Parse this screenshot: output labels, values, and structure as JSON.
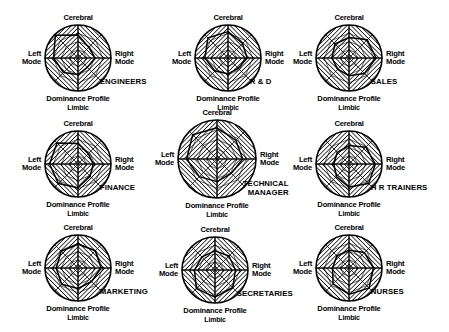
{
  "figure": {
    "axis_labels": {
      "top": "Cerebral",
      "bottom": "Limbic",
      "left": "Left\nMode",
      "left_line1": "Left",
      "left_line2": "Mode",
      "right_line1": "Right",
      "right_line2": "Mode",
      "caption": "Dominance Profile"
    },
    "colors": {
      "ink": "#000000",
      "background": "#ffffff",
      "hatch": "#000000"
    },
    "grid": {
      "rows": 3,
      "cols": 3
    }
  },
  "chart_data": {
    "type": "radar",
    "axes": [
      "Cerebral",
      "Cerebral-Right",
      "Right Mode",
      "Limbic-Right",
      "Limbic",
      "Limbic-Left",
      "Left Mode",
      "Cerebral-Left"
    ],
    "axis_order_note": "Values listed clockwise starting at top (Cerebral).",
    "rmax": 1.0,
    "rings": [
      0.25,
      0.5,
      0.75,
      1.0
    ],
    "grid": true,
    "legend": "none",
    "series": [
      {
        "name": "ENGINEERS",
        "row": 1,
        "col": 1,
        "values": [
          0.7,
          0.46,
          0.52,
          0.4,
          0.5,
          0.62,
          0.74,
          0.97
        ]
      },
      {
        "name": "R & D",
        "row": 1,
        "col": 2,
        "values": [
          0.8,
          0.62,
          0.58,
          0.44,
          0.48,
          0.56,
          0.7,
          0.86
        ]
      },
      {
        "name": "SALES",
        "row": 1,
        "col": 3,
        "values": [
          0.62,
          0.78,
          0.82,
          0.66,
          0.54,
          0.48,
          0.52,
          0.6
        ]
      },
      {
        "name": "FINANCE",
        "row": 2,
        "col": 1,
        "values": [
          0.62,
          0.44,
          0.46,
          0.52,
          0.72,
          0.84,
          0.86,
          0.9
        ]
      },
      {
        "name": "TECHNICAL MANAGER",
        "row": 2,
        "col": 2,
        "values": [
          0.8,
          0.68,
          0.66,
          0.52,
          0.58,
          0.64,
          0.78,
          0.88
        ]
      },
      {
        "name": "H R TRAINERS",
        "row": 2,
        "col": 3,
        "values": [
          0.56,
          0.72,
          0.8,
          0.84,
          0.7,
          0.54,
          0.46,
          0.5
        ]
      },
      {
        "name": "MARKETING",
        "row": 3,
        "col": 1,
        "values": [
          0.72,
          0.74,
          0.7,
          0.58,
          0.62,
          0.7,
          0.66,
          0.72
        ]
      },
      {
        "name": "SECRETARIES",
        "row": 3,
        "col": 2,
        "values": [
          0.58,
          0.6,
          0.62,
          0.76,
          0.82,
          0.8,
          0.62,
          0.56
        ]
      },
      {
        "name": "NURSES",
        "row": 3,
        "col": 3,
        "values": [
          0.54,
          0.66,
          0.74,
          0.86,
          0.8,
          0.68,
          0.5,
          0.52
        ]
      }
    ]
  },
  "cells": [
    {
      "occupation": "ENGINEERS",
      "occupation_lines": [
        "ENGINEERS"
      ],
      "top": "Cerebral",
      "bottom": "Limbic",
      "caption": "Dominance Profile",
      "left1": "Left",
      "left2": "Mode",
      "right1": "Right",
      "right2": "Mode"
    },
    {
      "occupation": "R & D",
      "occupation_lines": [
        "R & D"
      ],
      "top": "Cerebral",
      "bottom": "Limbic",
      "caption": "Dominance Profile",
      "left1": "Left",
      "left2": "Mode",
      "right1": "Right",
      "right2": "Mode"
    },
    {
      "occupation": "SALES",
      "occupation_lines": [
        "SALES"
      ],
      "top": "Cerebral",
      "bottom": "Limbic",
      "caption": "Dominance Profile",
      "left1": "Left",
      "left2": "Mode",
      "right1": "Right",
      "right2": "Mode"
    },
    {
      "occupation": "FINANCE",
      "occupation_lines": [
        "FINANCE"
      ],
      "top": "Cerebral",
      "bottom": "Limbic",
      "caption": "Dominance Profile",
      "left1": "Left",
      "left2": "Mode",
      "right1": "Right",
      "right2": "Mode"
    },
    {
      "occupation": "TECHNICAL MANAGER",
      "occupation_lines": [
        "TECHNICAL",
        "MANAGER"
      ],
      "top": "Cerebral",
      "bottom": "Limbic",
      "caption": "Dominance Profile",
      "left1": "Left",
      "left2": "Mode",
      "right1": "Right",
      "right2": "Mode"
    },
    {
      "occupation": "H R TRAINERS",
      "occupation_lines": [
        "H R TRAINERS"
      ],
      "top": "Cerebral",
      "bottom": "Limbic",
      "caption": "Dominance Profile",
      "left1": "Left",
      "left2": "Mode",
      "right1": "Right",
      "right2": "Mode"
    },
    {
      "occupation": "MARKETING",
      "occupation_lines": [
        "MARKETING"
      ],
      "top": "Cerebral",
      "bottom": "Limbic",
      "caption": "Dominance Profile",
      "left1": "Left",
      "left2": "Mode",
      "right1": "Right",
      "right2": "Mode"
    },
    {
      "occupation": "SECRETARIES",
      "occupation_lines": [
        "SECRETARIES"
      ],
      "top": "Cerebral",
      "bottom": "Limbic",
      "caption": "Dominance Profile",
      "left1": "Left",
      "left2": "Mode",
      "right1": "Right",
      "right2": "Mode"
    },
    {
      "occupation": "NURSES",
      "occupation_lines": [
        "NURSES"
      ],
      "top": "Cerebral",
      "bottom": "Limbic",
      "caption": "Dominance Profile",
      "left1": "Left",
      "left2": "Mode",
      "right1": "Right",
      "right2": "Mode"
    }
  ],
  "layout": {
    "cells": [
      {
        "cx": 78,
        "cy": 58,
        "r": 33
      },
      {
        "cx": 228,
        "cy": 58,
        "r": 33
      },
      {
        "cx": 349,
        "cy": 58,
        "r": 33
      },
      {
        "cx": 78,
        "cy": 164,
        "r": 33
      },
      {
        "cx": 217,
        "cy": 159,
        "r": 39
      },
      {
        "cx": 349,
        "cy": 164,
        "r": 33
      },
      {
        "cx": 78,
        "cy": 268,
        "r": 33
      },
      {
        "cx": 215,
        "cy": 270,
        "r": 33
      },
      {
        "cx": 349,
        "cy": 268,
        "r": 33
      }
    ]
  }
}
